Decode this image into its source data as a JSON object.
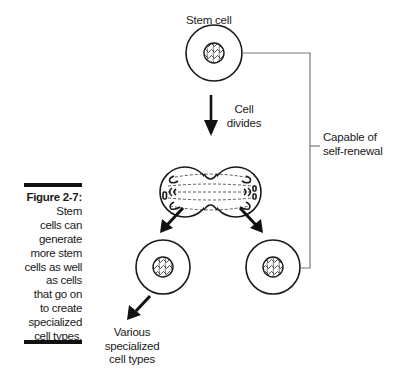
{
  "figure": {
    "number": "Figure 2-7:",
    "caption": "Stem cells can generate more stem cells as well as cells that go on to create specialized cell types.",
    "caption_lines": [
      "Stem",
      "cells can",
      "generate",
      "more stem",
      "cells as well",
      "as cells",
      "that go on",
      "to create",
      "specialized",
      "cell types."
    ]
  },
  "diagram": {
    "stem_cell_label": "Stem cell",
    "divide_label_line1": "Cell",
    "divide_label_line2": "divides",
    "self_renewal_line1": "Capable of",
    "self_renewal_line2": "self-renewal",
    "specialized_line1": "Various",
    "specialized_line2": "specialized",
    "specialized_line3": "cell types"
  },
  "colors": {
    "ink": "#1a1a1a",
    "bracket": "#777777",
    "background": "#ffffff"
  }
}
